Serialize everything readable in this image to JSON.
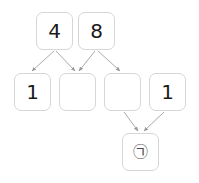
{
  "diagram": {
    "type": "flow-diagram",
    "background_color": "#ffffff",
    "node_border_color": "#d6d6d6",
    "node_fill_color": "#ffffff",
    "edge_color": "#a9a9a9",
    "text_color": "#1a1a1a",
    "rows": [
      {
        "name": "top-row",
        "nodes": [
          {
            "id": "n1",
            "label": "4",
            "x": 36,
            "y": 12,
            "w": 37,
            "h": 38
          },
          {
            "id": "n2",
            "label": "8",
            "x": 78,
            "y": 12,
            "w": 37,
            "h": 38
          }
        ]
      },
      {
        "name": "middle-row",
        "nodes": [
          {
            "id": "m1",
            "label": "1",
            "x": 14,
            "y": 73,
            "w": 37,
            "h": 38
          },
          {
            "id": "m2",
            "label": "",
            "x": 59,
            "y": 73,
            "w": 37,
            "h": 38
          },
          {
            "id": "m3",
            "label": "",
            "x": 104,
            "y": 73,
            "w": 37,
            "h": 38
          },
          {
            "id": "m4",
            "label": "1",
            "x": 149,
            "y": 73,
            "w": 37,
            "h": 38
          }
        ]
      },
      {
        "name": "bottom-row",
        "nodes": [
          {
            "id": "b1",
            "label": "㉠",
            "x": 122,
            "y": 133,
            "w": 37,
            "h": 38
          }
        ]
      }
    ],
    "edges": [
      {
        "from": "n1",
        "to": "m1",
        "x1": 54,
        "y1": 51,
        "x2": 32,
        "y2": 71
      },
      {
        "from": "n1",
        "to": "m2",
        "x1": 56,
        "y1": 51,
        "x2": 75,
        "y2": 71
      },
      {
        "from": "n2",
        "to": "m2",
        "x1": 95,
        "y1": 51,
        "x2": 79,
        "y2": 71
      },
      {
        "from": "n2",
        "to": "m3",
        "x1": 98,
        "y1": 51,
        "x2": 120,
        "y2": 71
      },
      {
        "from": "m3",
        "to": "b1",
        "x1": 124,
        "y1": 112,
        "x2": 138,
        "y2": 131
      },
      {
        "from": "m4",
        "to": "b1",
        "x1": 164,
        "y1": 112,
        "x2": 144,
        "y2": 131
      }
    ]
  }
}
